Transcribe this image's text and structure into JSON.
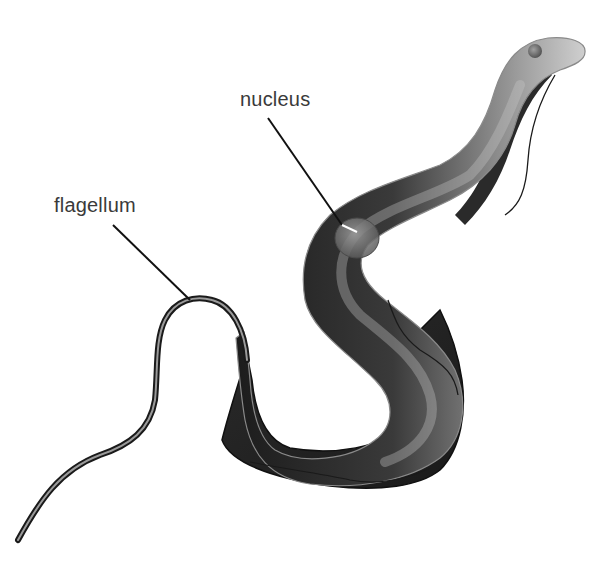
{
  "figure": {
    "labels": {
      "nucleus": "nucleus",
      "flagellum": "flagellum"
    },
    "colors": {
      "background": "#ffffff",
      "body_dark": "#1a1a1a",
      "body_mid": "#6e6e6e",
      "body_light": "#d6d6d6",
      "leader_line": "#111111",
      "label_text": "#3a3a3a"
    }
  }
}
